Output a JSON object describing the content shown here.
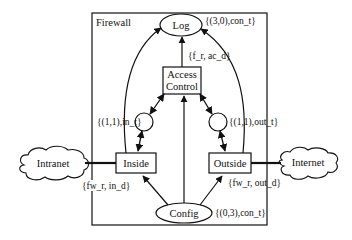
{
  "diagram": {
    "container_label": "Firewall",
    "places": {
      "log": "Log",
      "config": "Config",
      "in_place": "",
      "out_place": ""
    },
    "transitions": {
      "access_control_line1": "Access",
      "access_control_line2": "Control",
      "inside": "Inside",
      "outside": "Outside"
    },
    "external": {
      "intranet": "Intranet",
      "internet": "Internet"
    },
    "arc_labels": {
      "log_marking": "{(3,0),con_t}",
      "access_to_log": "{f_r, ac_d}",
      "in_marking": "{(1,1),in_t}",
      "out_marking": "{(1,1),out_t}",
      "inside_intranet": "{fw_r, in_d}",
      "outside_internet": "{fw_r, out_d}",
      "config_marking": "{(0,3),con_t}"
    },
    "colors": {
      "stroke": "#111111",
      "background": "#ffffff"
    }
  }
}
